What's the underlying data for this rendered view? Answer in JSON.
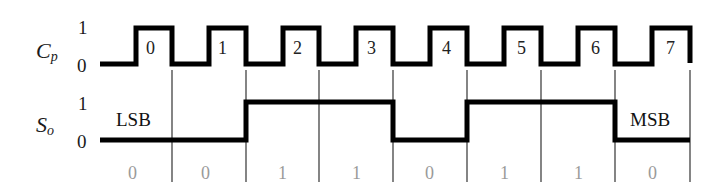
{
  "diagram": {
    "type": "timing-diagram",
    "signals": [
      {
        "name": "C",
        "subscript": "p",
        "levels": [
          "1",
          "0"
        ],
        "kind": "clock"
      },
      {
        "name": "S",
        "subscript": "o",
        "levels": [
          "1",
          "0"
        ],
        "kind": "serial-output"
      }
    ],
    "clock_pulse_labels": [
      "0",
      "1",
      "2",
      "3",
      "4",
      "5",
      "6",
      "7"
    ],
    "serial_bits": [
      "0",
      "0",
      "1",
      "1",
      "0",
      "1",
      "1",
      "0"
    ],
    "lsb_label": "LSB",
    "msb_label": "MSB",
    "colors": {
      "waveform": "#000000",
      "gridline": "#333333",
      "bit_text": "#9a9a9a"
    }
  }
}
